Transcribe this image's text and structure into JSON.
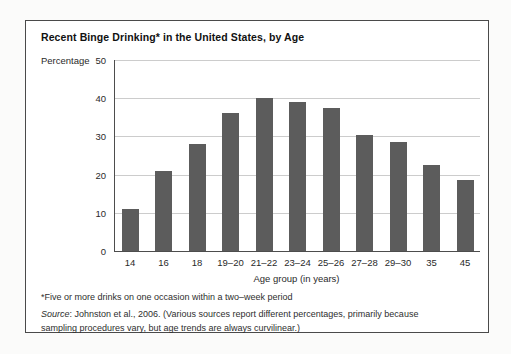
{
  "figure": {
    "title": "Recent Binge Drinking* in the United States, by Age",
    "footnote": "*Five or more drinks on one occasion within a two–week period",
    "source_word": "Source",
    "source_line1_rest": ": Johnston et al., 2006. (Various sources report different percentages, primarily because",
    "source_line2": "sampling procedures vary, but age trends are always curvilinear.)"
  },
  "chart_data": {
    "type": "bar",
    "title": "Recent Binge Drinking* in the United States, by Age",
    "categories": [
      "14",
      "16",
      "18",
      "19–20",
      "21–22",
      "23–24",
      "25–26",
      "27–28",
      "29–30",
      "35",
      "45"
    ],
    "values": [
      11,
      21,
      28,
      36,
      40,
      39,
      37.5,
      30.5,
      28.5,
      22.5,
      18.5
    ],
    "xlabel": "Age group (in years)",
    "ylabel": "Percentage",
    "ylim": [
      0,
      50
    ],
    "yticks": [
      0,
      10,
      20,
      30,
      40,
      50
    ],
    "grid": "horizontal",
    "legend": "none",
    "bar_color": "#5c5c5c",
    "gridline_color": "#cccccc",
    "axis_color": "#4d4d4d"
  }
}
